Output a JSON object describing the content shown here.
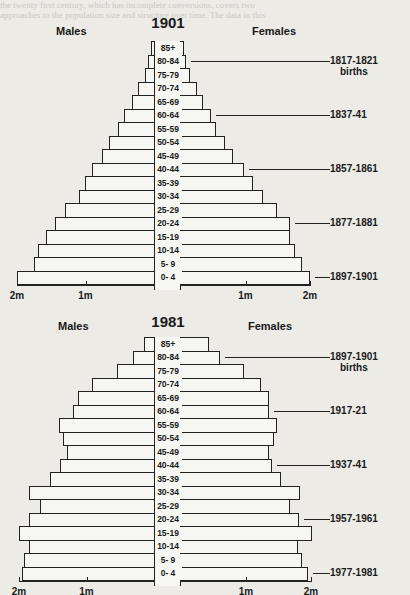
{
  "background_text": [
    "the twenty first century, which has incomplete conversions, covers two",
    "approaches to the population size and structure over time. The data in this",
    "analysis are discussed as a whole which will be compared in the years that are",
    "to be analysed in such as. Note that all figures concern the population, if any",
    "there was a wide range of changes in numbers of people at each of these ages"
  ],
  "pyramids": [
    {
      "year_label": "1901",
      "males_label": "Males",
      "females_label": "Females",
      "axis_ticks_left": [
        "2m",
        "1m"
      ],
      "axis_ticks_right": [
        "1m",
        "2m"
      ],
      "annotations": [
        {
          "text": "1817-1821",
          "subtext": "births",
          "age": "80-84"
        },
        {
          "text": "1837-41",
          "subtext": "",
          "age": "60-64"
        },
        {
          "text": "1857-1861",
          "subtext": "",
          "age": "40-44"
        },
        {
          "text": "1877-1881",
          "subtext": "",
          "age": "20-24"
        },
        {
          "text": "1897-1901",
          "subtext": "",
          "age": "0- 4"
        }
      ]
    },
    {
      "year_label": "1981",
      "males_label": "Males",
      "females_label": "Females",
      "axis_ticks_left": [
        "2m",
        "1m"
      ],
      "axis_ticks_right": [
        "1m",
        "2m"
      ],
      "annotations": [
        {
          "text": "1897-1901",
          "subtext": "births",
          "age": "80-84"
        },
        {
          "text": "1917-21",
          "subtext": "",
          "age": "60-64"
        },
        {
          "text": "1937-41",
          "subtext": "",
          "age": "40-44"
        },
        {
          "text": "1957-1961",
          "subtext": "",
          "age": "20-24"
        },
        {
          "text": "1977-1981",
          "subtext": "",
          "age": "0- 4"
        }
      ]
    }
  ],
  "chart_data": [
    {
      "type": "bar",
      "subtype": "population-pyramid",
      "title": "1901",
      "xlabel": "Population (millions)",
      "ylabel": "Age group",
      "categories": [
        "85+",
        "80-84",
        "75-79",
        "70-74",
        "65-69",
        "60-64",
        "55-59",
        "50-54",
        "45-49",
        "40-44",
        "35-39",
        "30-34",
        "25-29",
        "20-24",
        "15-19",
        "10-14",
        "5- 9",
        "0- 4"
      ],
      "series": [
        {
          "name": "Males",
          "side": "left",
          "values": [
            0.04,
            0.09,
            0.13,
            0.23,
            0.32,
            0.44,
            0.53,
            0.66,
            0.76,
            0.91,
            1.01,
            1.09,
            1.3,
            1.45,
            1.58,
            1.69,
            1.75,
            2.0
          ]
        },
        {
          "name": "Females",
          "side": "right",
          "values": [
            0.05,
            0.08,
            0.14,
            0.25,
            0.34,
            0.47,
            0.54,
            0.68,
            0.81,
            0.98,
            1.12,
            1.27,
            1.49,
            1.69,
            1.69,
            1.77,
            1.88,
            2.0
          ]
        }
      ],
      "xlim": [
        0,
        2
      ],
      "xticks": [
        "2m",
        "1m",
        "1m",
        "2m"
      ],
      "annotations": [
        "1817-1821 births (80-84)",
        "1837-41 (60-64)",
        "1857-1861 (40-44)",
        "1877-1881 (20-24)",
        "1897-1901 (0-4)"
      ],
      "grid": false
    },
    {
      "type": "bar",
      "subtype": "population-pyramid",
      "title": "1981",
      "xlabel": "Population (millions)",
      "ylabel": "Age group",
      "categories": [
        "85+",
        "80-84",
        "75-79",
        "70-74",
        "65-69",
        "60-64",
        "55-59",
        "50-54",
        "45-49",
        "40-44",
        "35-39",
        "30-34",
        "25-29",
        "20-24",
        "15-19",
        "10-14",
        "5- 9",
        "0- 4"
      ],
      "series": [
        {
          "name": "Males",
          "side": "left",
          "values": [
            0.15,
            0.31,
            0.55,
            0.92,
            1.13,
            1.2,
            1.41,
            1.35,
            1.29,
            1.39,
            1.54,
            1.85,
            1.69,
            1.85,
            2.0,
            1.85,
            1.93,
            1.96
          ]
        },
        {
          "name": "Females",
          "side": "right",
          "values": [
            0.43,
            0.6,
            0.97,
            1.23,
            1.35,
            1.35,
            1.48,
            1.43,
            1.35,
            1.4,
            1.54,
            1.83,
            1.68,
            1.82,
            2.02,
            1.8,
            1.86,
            1.95
          ]
        }
      ],
      "xlim": [
        0,
        2
      ],
      "xticks": [
        "2m",
        "1m",
        "1m",
        "2m"
      ],
      "annotations": [
        "1897-1901 births (80-84)",
        "1917-21 (60-64)",
        "1937-41 (40-44)",
        "1957-1961 (20-24)",
        "1977-1981 (0-4)"
      ],
      "grid": false
    }
  ]
}
